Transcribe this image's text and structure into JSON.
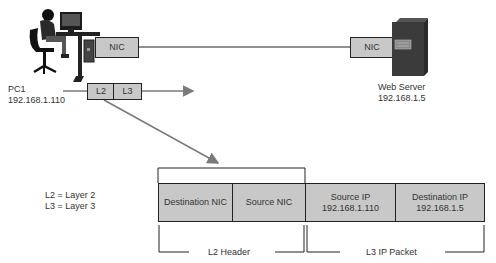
{
  "devices": {
    "pc": {
      "name": "PC1",
      "ip": "192.168.1.110",
      "icon": "workstation-user-icon",
      "nic_label": "NIC"
    },
    "server": {
      "name": "Web Server",
      "ip": "192.168.1.5",
      "icon": "server-tower-icon",
      "nic_label": "NIC"
    }
  },
  "encapsulation": {
    "l2_label": "L2",
    "l3_label": "L3"
  },
  "legend": {
    "line1": "L2 = Layer 2",
    "line2": "L3 = Layer 3"
  },
  "frame": {
    "fields": [
      {
        "line1": "Destination NIC",
        "line2": ""
      },
      {
        "line1": "Source NIC",
        "line2": ""
      },
      {
        "line1": "Source IP",
        "line2": "192.168.1.110"
      },
      {
        "line1": "Destination IP",
        "line2": "192.168.1.5"
      }
    ],
    "groups": {
      "l2": "L2 Header",
      "l3": "L3 IP Packet"
    }
  },
  "colors": {
    "box_fill": "#c8c8c8",
    "arrow": "#7a7a7a",
    "line": "#222222"
  }
}
